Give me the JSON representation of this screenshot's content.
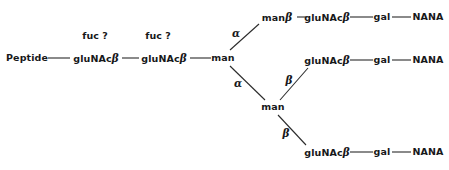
{
  "figure": {
    "kind": "glycan-branching-diagram",
    "background_color": "#ffffff",
    "line_color": "#2b2b2b",
    "text_color": "#17181a",
    "width": 449,
    "height": 170
  },
  "nodes": {
    "peptide": {
      "label": "Peptide",
      "x": 27,
      "y": 58
    },
    "core_glunac_1": {
      "stem": "gluNAc",
      "greek": "β",
      "x": 96,
      "y": 58
    },
    "core_glunac_2": {
      "stem": "gluNAc",
      "greek": "β",
      "x": 164,
      "y": 58
    },
    "core_man": {
      "label": "man",
      "x": 223,
      "y": 58
    },
    "upper_man": {
      "stem": "man",
      "greek": "β",
      "x": 277,
      "y": 17
    },
    "lower_man": {
      "label": "man",
      "x": 273,
      "y": 107
    },
    "arm1_glunac": {
      "stem": "gluNAc",
      "greek": "β",
      "x": 327,
      "y": 17
    },
    "arm1_gal": {
      "label": "gal",
      "x": 382,
      "y": 17
    },
    "arm1_nana": {
      "label": "NANA",
      "x": 428,
      "y": 17
    },
    "arm2_glunac": {
      "stem": "gluNAc",
      "greek": "β",
      "x": 327,
      "y": 60
    },
    "arm2_gal": {
      "label": "gal",
      "x": 382,
      "y": 60
    },
    "arm2_nana": {
      "label": "NANA",
      "x": 428,
      "y": 60
    },
    "arm3_glunac": {
      "stem": "gluNAc",
      "greek": "β",
      "x": 327,
      "y": 152
    },
    "arm3_gal": {
      "label": "gal",
      "x": 382,
      "y": 152
    },
    "arm3_nana": {
      "label": "NANA",
      "x": 428,
      "y": 152
    }
  },
  "annotations": {
    "fuc_query_1": {
      "label": "fuc ?",
      "x": 95,
      "y": 36
    },
    "fuc_query_2": {
      "label": "fuc ?",
      "x": 158,
      "y": 36
    }
  },
  "linkages": {
    "alpha_upper": {
      "label": "α",
      "x": 236,
      "y": 33
    },
    "alpha_lower": {
      "label": "α",
      "x": 238,
      "y": 83
    },
    "beta_arm2": {
      "label": "β",
      "x": 289,
      "y": 80
    },
    "beta_arm3": {
      "label": "β",
      "x": 286,
      "y": 133
    }
  },
  "bonds": [
    {
      "name": "peptide-to-glunac1",
      "x1": 48,
      "y1": 58,
      "x2": 70,
      "y2": 58
    },
    {
      "name": "glunac1-to-glunac2",
      "x1": 122,
      "y1": 58,
      "x2": 139,
      "y2": 58
    },
    {
      "name": "glunac2-to-man",
      "x1": 190,
      "y1": 58,
      "x2": 211,
      "y2": 58
    },
    {
      "name": "man-to-upper-man-alpha",
      "x1": 230,
      "y1": 50,
      "x2": 259,
      "y2": 24
    },
    {
      "name": "man-to-lower-man-alpha",
      "x1": 230,
      "y1": 66,
      "x2": 265,
      "y2": 100
    },
    {
      "name": "upper-man-to-arm1-glunac",
      "x1": 297,
      "y1": 17,
      "x2": 306,
      "y2": 17
    },
    {
      "name": "arm1-glunac-to-gal",
      "x1": 350,
      "y1": 17,
      "x2": 373,
      "y2": 17
    },
    {
      "name": "arm1-gal-to-nana",
      "x1": 392,
      "y1": 17,
      "x2": 411,
      "y2": 17
    },
    {
      "name": "lower-man-to-arm2-glunac-beta",
      "x1": 280,
      "y1": 100,
      "x2": 308,
      "y2": 68
    },
    {
      "name": "arm2-glunac-to-gal",
      "x1": 350,
      "y1": 60,
      "x2": 373,
      "y2": 60
    },
    {
      "name": "arm2-gal-to-nana",
      "x1": 392,
      "y1": 60,
      "x2": 411,
      "y2": 60
    },
    {
      "name": "lower-man-to-arm3-glunac-beta",
      "x1": 278,
      "y1": 115,
      "x2": 306,
      "y2": 145
    },
    {
      "name": "arm3-glunac-to-gal",
      "x1": 350,
      "y1": 152,
      "x2": 373,
      "y2": 152
    },
    {
      "name": "arm3-gal-to-nana",
      "x1": 392,
      "y1": 152,
      "x2": 411,
      "y2": 152
    }
  ]
}
